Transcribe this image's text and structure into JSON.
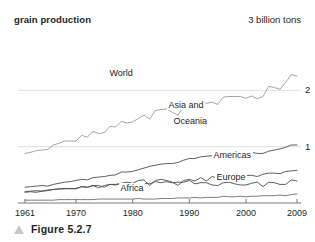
{
  "figure": {
    "caption": "Figure 5.2.7",
    "marker_icon": "triangle-marker-icon",
    "marker_color": "#c8c9cb"
  },
  "chart_data": {
    "type": "line",
    "title": "grain production",
    "xlabel": "",
    "ylabel": "",
    "top_annotation": "3 billion tons",
    "xlim": [
      1961,
      2009
    ],
    "ylim": [
      0,
      3
    ],
    "grid": true,
    "gridlines": [
      {
        "value": 2,
        "label": "2"
      },
      {
        "value": 1,
        "label": "1"
      },
      {
        "value": 0,
        "label": ""
      }
    ],
    "xticks": [
      1961,
      1970,
      1980,
      1990,
      2000,
      2009
    ],
    "xtick_labels": [
      "1961",
      "1970",
      "1980",
      "1990",
      "2000",
      "2009"
    ],
    "legend_position": "inline-labels",
    "series": [
      {
        "name": "World",
        "label": "World",
        "color": "#9a9a9a",
        "x": [
          1961,
          1962,
          1963,
          1964,
          1965,
          1966,
          1967,
          1968,
          1969,
          1970,
          1971,
          1972,
          1973,
          1974,
          1975,
          1976,
          1977,
          1978,
          1979,
          1980,
          1981,
          1982,
          1983,
          1984,
          1985,
          1986,
          1987,
          1988,
          1989,
          1990,
          1991,
          1992,
          1993,
          1994,
          1995,
          1996,
          1997,
          1998,
          1999,
          2000,
          2001,
          2002,
          2003,
          2004,
          2005,
          2006,
          2007,
          2008,
          2009
        ],
        "values": [
          0.88,
          0.9,
          0.93,
          0.94,
          0.95,
          1.03,
          1.06,
          1.1,
          1.1,
          1.1,
          1.2,
          1.17,
          1.27,
          1.23,
          1.25,
          1.36,
          1.35,
          1.45,
          1.42,
          1.44,
          1.5,
          1.56,
          1.49,
          1.64,
          1.66,
          1.67,
          1.61,
          1.56,
          1.71,
          1.78,
          1.71,
          1.82,
          1.77,
          1.79,
          1.75,
          1.88,
          1.89,
          1.89,
          1.89,
          1.86,
          1.9,
          1.85,
          1.89,
          2.07,
          2.05,
          2.02,
          2.14,
          2.28,
          2.25
        ],
        "unit": "billion tons"
      },
      {
        "name": "Asia and Oceania",
        "label": "Asia and Oceania",
        "label_lines": [
          "Asia and",
          "Oceania"
        ],
        "color": "#4d4d4d",
        "x": [
          1961,
          1962,
          1963,
          1964,
          1965,
          1966,
          1967,
          1968,
          1969,
          1970,
          1971,
          1972,
          1973,
          1974,
          1975,
          1976,
          1977,
          1978,
          1979,
          1980,
          1981,
          1982,
          1983,
          1984,
          1985,
          1986,
          1987,
          1988,
          1989,
          1990,
          1991,
          1992,
          1993,
          1994,
          1995,
          1996,
          1997,
          1998,
          1999,
          2000,
          2001,
          2002,
          2003,
          2004,
          2005,
          2006,
          2007,
          2008,
          2009
        ],
        "values": [
          0.28,
          0.29,
          0.3,
          0.31,
          0.3,
          0.33,
          0.35,
          0.37,
          0.38,
          0.4,
          0.42,
          0.41,
          0.45,
          0.46,
          0.47,
          0.49,
          0.5,
          0.55,
          0.55,
          0.56,
          0.59,
          0.62,
          0.65,
          0.67,
          0.69,
          0.7,
          0.7,
          0.72,
          0.76,
          0.79,
          0.79,
          0.82,
          0.83,
          0.84,
          0.85,
          0.89,
          0.9,
          0.91,
          0.92,
          0.89,
          0.9,
          0.88,
          0.88,
          0.92,
          0.94,
          0.96,
          0.99,
          1.03,
          1.03
        ],
        "unit": "billion tons"
      },
      {
        "name": "Americas",
        "label": "Americas",
        "color": "#4d4d4d",
        "x": [
          1961,
          1962,
          1963,
          1964,
          1965,
          1966,
          1967,
          1968,
          1969,
          1970,
          1971,
          1972,
          1973,
          1974,
          1975,
          1976,
          1977,
          1978,
          1979,
          1980,
          1981,
          1982,
          1983,
          1984,
          1985,
          1986,
          1987,
          1988,
          1989,
          1990,
          1991,
          1992,
          1993,
          1994,
          1995,
          1996,
          1997,
          1998,
          1999,
          2000,
          2001,
          2002,
          2003,
          2004,
          2005,
          2006,
          2007,
          2008,
          2009
        ],
        "values": [
          0.2,
          0.21,
          0.22,
          0.21,
          0.23,
          0.24,
          0.25,
          0.25,
          0.26,
          0.25,
          0.29,
          0.28,
          0.31,
          0.27,
          0.31,
          0.33,
          0.33,
          0.35,
          0.37,
          0.35,
          0.4,
          0.41,
          0.31,
          0.4,
          0.42,
          0.4,
          0.37,
          0.31,
          0.4,
          0.42,
          0.39,
          0.45,
          0.39,
          0.47,
          0.44,
          0.48,
          0.49,
          0.49,
          0.49,
          0.49,
          0.49,
          0.47,
          0.51,
          0.53,
          0.53,
          0.52,
          0.56,
          0.57,
          0.58
        ],
        "unit": "billion tons"
      },
      {
        "name": "Europe",
        "label": "Europe",
        "color": "#4d4d4d",
        "x": [
          1961,
          1962,
          1963,
          1964,
          1965,
          1966,
          1967,
          1968,
          1969,
          1970,
          1971,
          1972,
          1973,
          1974,
          1975,
          1976,
          1977,
          1978,
          1979,
          1980,
          1981,
          1982,
          1983,
          1984,
          1985,
          1986,
          1987,
          1988,
          1989,
          1990,
          1991,
          1992,
          1993,
          1994,
          1995,
          1996,
          1997,
          1998,
          1999,
          2000,
          2001,
          2002,
          2003,
          2004,
          2005,
          2006,
          2007,
          2008,
          2009
        ],
        "values": [
          0.19,
          0.2,
          0.19,
          0.21,
          0.22,
          0.24,
          0.25,
          0.26,
          0.25,
          0.26,
          0.29,
          0.28,
          0.31,
          0.31,
          0.28,
          0.33,
          0.32,
          0.35,
          0.32,
          0.34,
          0.31,
          0.35,
          0.34,
          0.38,
          0.36,
          0.38,
          0.36,
          0.37,
          0.37,
          0.4,
          0.34,
          0.36,
          0.36,
          0.32,
          0.31,
          0.36,
          0.37,
          0.34,
          0.32,
          0.32,
          0.35,
          0.37,
          0.29,
          0.37,
          0.36,
          0.33,
          0.33,
          0.41,
          0.39
        ],
        "unit": "billion tons"
      },
      {
        "name": "Africa",
        "label": "Africa",
        "color": "#6e6e6e",
        "x": [
          1961,
          1962,
          1963,
          1964,
          1965,
          1966,
          1967,
          1968,
          1969,
          1970,
          1971,
          1972,
          1973,
          1974,
          1975,
          1976,
          1977,
          1978,
          1979,
          1980,
          1981,
          1982,
          1983,
          1984,
          1985,
          1986,
          1987,
          1988,
          1989,
          1990,
          1991,
          1992,
          1993,
          1994,
          1995,
          1996,
          1997,
          1998,
          1999,
          2000,
          2001,
          2002,
          2003,
          2004,
          2005,
          2006,
          2007,
          2008,
          2009
        ],
        "values": [
          0.05,
          0.05,
          0.05,
          0.05,
          0.05,
          0.05,
          0.06,
          0.06,
          0.06,
          0.06,
          0.06,
          0.06,
          0.06,
          0.07,
          0.07,
          0.07,
          0.07,
          0.07,
          0.07,
          0.07,
          0.08,
          0.07,
          0.07,
          0.07,
          0.08,
          0.08,
          0.08,
          0.09,
          0.09,
          0.09,
          0.1,
          0.09,
          0.1,
          0.1,
          0.1,
          0.12,
          0.11,
          0.11,
          0.12,
          0.11,
          0.12,
          0.12,
          0.13,
          0.13,
          0.13,
          0.14,
          0.13,
          0.15,
          0.16
        ],
        "unit": "billion tons"
      }
    ]
  }
}
